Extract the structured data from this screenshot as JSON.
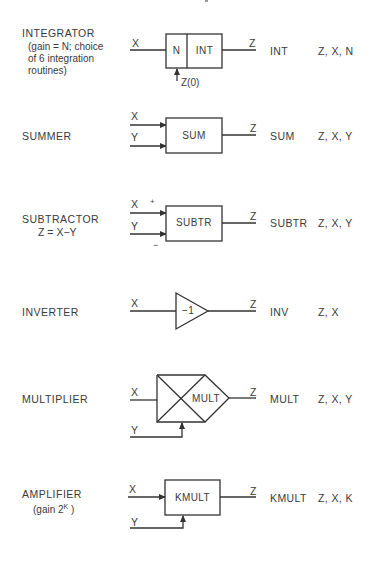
{
  "header": {
    "artifact": "'"
  },
  "elements": [
    {
      "id": "integrator",
      "label": "INTEGRATOR",
      "note_lines": [
        "(gain = N; choice",
        "of 6 integration",
        "routines)"
      ],
      "inputs": [
        "X"
      ],
      "output": "Z",
      "side_input": "Z(0)",
      "block_cells": [
        "N",
        "INT"
      ],
      "mnemonic": "INT",
      "args": "Z, X, N"
    },
    {
      "id": "summer",
      "label": "SUMMER",
      "inputs": [
        "X",
        "Y"
      ],
      "output": "Z",
      "block": "SUM",
      "mnemonic": "SUM",
      "args": "Z, X, Y"
    },
    {
      "id": "subtractor",
      "label": "SUBTRACTOR",
      "note": "Z = X−Y",
      "inputs": [
        "X",
        "Y"
      ],
      "signs": [
        "+",
        "−"
      ],
      "output": "Z",
      "block": "SUBTR",
      "mnemonic": "SUBTR",
      "args": "Z, X, Y"
    },
    {
      "id": "inverter",
      "label": "INVERTER",
      "inputs": [
        "X"
      ],
      "output": "Z",
      "block": "−1",
      "mnemonic": "INV",
      "args": "Z, X"
    },
    {
      "id": "multiplier",
      "label": "MULTIPLIER",
      "inputs": [
        "X",
        "Y"
      ],
      "output": "Z",
      "block": "MULT",
      "mnemonic": "MULT",
      "args": "Z, X, Y"
    },
    {
      "id": "amplifier",
      "label": "AMPLIFIER",
      "note_prefix": "(gain 2",
      "note_sup": "K",
      "note_suffix": " )",
      "inputs": [
        "X",
        "Y"
      ],
      "output": "Z",
      "block": "KMULT",
      "mnemonic": "KMULT",
      "args": "Z, X, K"
    }
  ],
  "colors": {
    "line": "#333333",
    "text": "#3a3a3a",
    "background": "#ffffff"
  }
}
